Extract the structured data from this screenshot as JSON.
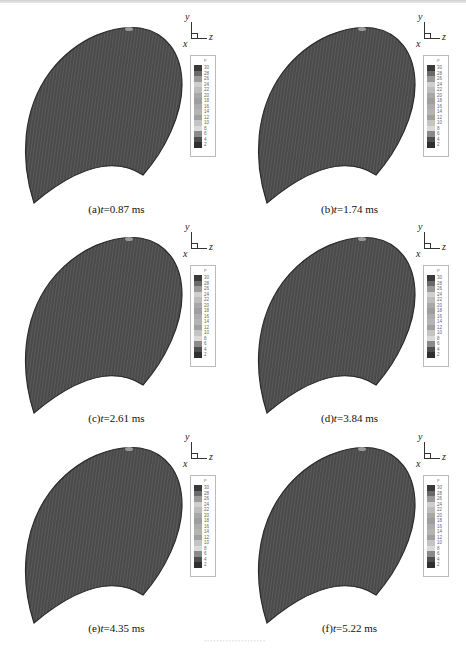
{
  "figure": {
    "surface_color": "#4a4a4a",
    "surface_edge_color": "#2a2a2a",
    "triad_labels": {
      "y": "y",
      "z": "z",
      "x": "x"
    },
    "legend": {
      "title": "P",
      "levels": [
        "30",
        "28",
        "26",
        "24",
        "22",
        "20",
        "18",
        "16",
        "14",
        "12",
        "10",
        "8",
        "6",
        "4",
        "2"
      ],
      "colors": [
        "#3a3a3a",
        "#6a6a6a",
        "#9a9a9a",
        "#cfcfcf",
        "#bdbdbd",
        "#a8a8a8",
        "#9e9e9e",
        "#acacac",
        "#b4b4b4",
        "#a0a0a0",
        "#c4c4c4",
        "#dadada",
        "#8a8a8a",
        "#4e4e4e",
        "#303030"
      ]
    },
    "panels": [
      {
        "id": "a",
        "prefix": "(a)",
        "var": "t",
        "value": "=0.87 ms"
      },
      {
        "id": "b",
        "prefix": "(b)",
        "var": "t",
        "value": "=1.74 ms"
      },
      {
        "id": "c",
        "prefix": "(c)",
        "var": "t",
        "value": "=2.61 ms"
      },
      {
        "id": "d",
        "prefix": "(d)",
        "var": "t",
        "value": "=3.84 ms"
      },
      {
        "id": "e",
        "prefix": "(e)",
        "var": "t",
        "value": "=4.35 ms"
      },
      {
        "id": "f",
        "prefix": "(f)",
        "var": "t",
        "value": "=5.22 ms"
      }
    ]
  }
}
